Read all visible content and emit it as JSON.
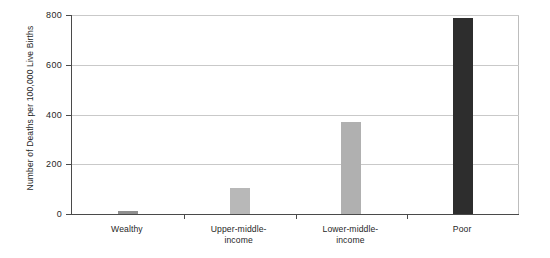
{
  "chart_data": {
    "type": "bar",
    "title": "",
    "subtitle": "",
    "xlabel": "",
    "ylabel": "Number of Deaths per 100,000 Live Births",
    "categories": [
      "Wealthy",
      "Upper-middle-income",
      "Lower-middle-income",
      "Poor"
    ],
    "category_lines": [
      [
        "Wealthy"
      ],
      [
        "Upper-middle-",
        "income"
      ],
      [
        "Lower-middle-",
        "income"
      ],
      [
        "Poor"
      ]
    ],
    "values": [
      14,
      106,
      370,
      790
    ],
    "ylim": [
      0,
      800
    ],
    "yticks": [
      0,
      200,
      400,
      600,
      800
    ],
    "ytick_labels": [
      "0",
      "200",
      "400",
      "600",
      "800"
    ],
    "grid": true,
    "grid_axis": "y",
    "legend": "none",
    "bar_colors": [
      "#8f8f8f",
      "#b8b8b8",
      "#b0b0b0",
      "#2d2d2d"
    ],
    "axis_color": "#4a4a4a",
    "grid_color": "#c9c9c9",
    "background": "#ffffff"
  }
}
